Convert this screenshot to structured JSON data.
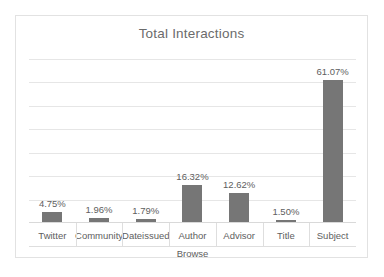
{
  "chart_data": {
    "type": "bar",
    "title": "Total Interactions",
    "xlabel": "Browse",
    "ylabel": "",
    "categories": [
      "Twitter",
      "Community",
      "Dateissued",
      "Author",
      "Advisor",
      "Title",
      "Subject"
    ],
    "values": [
      4.75,
      1.96,
      1.79,
      16.32,
      12.62,
      1.5,
      61.07
    ],
    "data_labels": [
      "4.75%",
      "1.96%",
      "1.79%",
      "16.32%",
      "12.62%",
      "1.50%",
      "61.07%"
    ],
    "ylim": [
      0,
      70
    ],
    "gridlines": 7,
    "grid": true,
    "legend": "none",
    "bar_color": "#767676",
    "gridline_color": "#e6e6e6",
    "text_color": "#5e5e5e",
    "title_color": "#6b6b6b",
    "background": "#ffffff",
    "border_color": "#e2e2e2"
  }
}
